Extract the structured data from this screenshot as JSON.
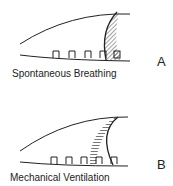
{
  "panels": [
    {
      "id": "A",
      "label": "A",
      "caption": "Spontaneous Breathing"
    },
    {
      "id": "B",
      "label": "B",
      "caption": "Mechanical Ventilation"
    }
  ],
  "colors": {
    "ink": "#222222",
    "hatch": "#555555",
    "background": "#ffffff"
  }
}
